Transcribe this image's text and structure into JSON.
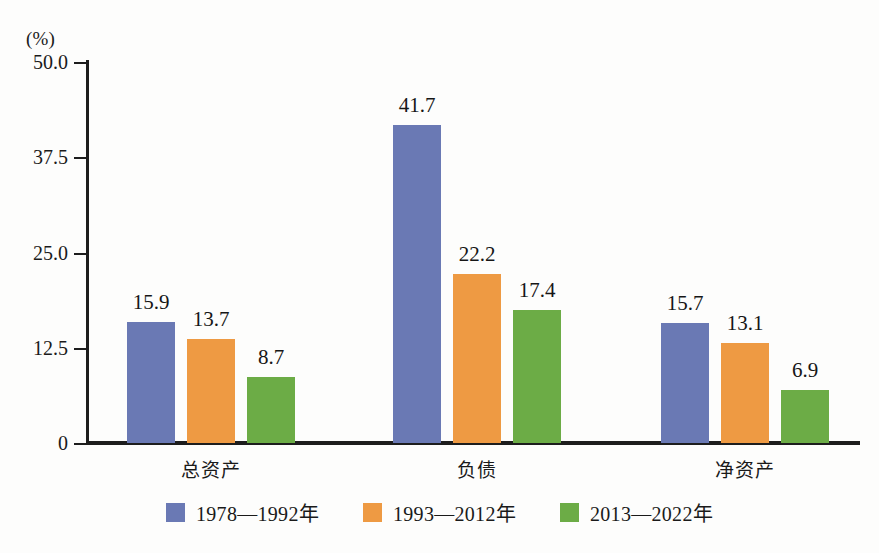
{
  "chart_data": {
    "type": "bar",
    "title": "",
    "subtitle": "",
    "xlabel": "",
    "ylabel": "",
    "unit_label": "(%)",
    "categories": [
      "总资产",
      "负债",
      "净资产"
    ],
    "series": [
      {
        "name": "1978—1992年",
        "color": "#6A79B4",
        "values": [
          15.9,
          41.7,
          15.7
        ]
      },
      {
        "name": "1993—2012年",
        "color": "#EE9A43",
        "values": [
          13.7,
          22.2,
          13.1
        ]
      },
      {
        "name": "2013—2022年",
        "color": "#6CAC46",
        "values": [
          8.7,
          17.4,
          6.9
        ]
      }
    ],
    "ylim": [
      0,
      50
    ],
    "yticks": [
      0,
      12.5,
      25.0,
      37.5,
      50.0
    ],
    "ytick_labels": [
      "0",
      "12.5",
      "25.0",
      "37.5",
      "50.0"
    ],
    "grid": false,
    "legend_position": "bottom",
    "value_labels": [
      [
        "15.9",
        "13.7",
        "8.7"
      ],
      [
        "41.7",
        "22.2",
        "17.4"
      ],
      [
        "15.7",
        "13.1",
        "6.9"
      ]
    ]
  },
  "colors": {
    "series_1": "#6A79B4",
    "series_2": "#EE9A43",
    "series_3": "#6CAC46",
    "axis": "#1d1d1d",
    "text": "#161616",
    "background": "#fdfdfc"
  }
}
